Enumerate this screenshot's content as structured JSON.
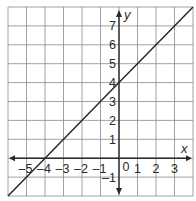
{
  "chart_data": {
    "type": "line",
    "title": "",
    "xlabel": "x",
    "ylabel": "y",
    "xlim": [
      -6,
      4
    ],
    "ylim": [
      -2,
      8
    ],
    "grid": true,
    "x_ticks": [
      "-5",
      "-4",
      "-3",
      "-2",
      "-1",
      "0",
      "1",
      "2",
      "3"
    ],
    "y_ticks": [
      "-1",
      "1",
      "2",
      "3",
      "4",
      "5",
      "6",
      "7"
    ],
    "series": [
      {
        "name": "y = x + 4",
        "equation": "y = x + 4",
        "slope": 1,
        "intercept": 4,
        "x": [
          -6,
          -4,
          0,
          3,
          4
        ],
        "y": [
          -2,
          0,
          4,
          7,
          8
        ]
      }
    ]
  },
  "colors": {
    "grid": "#8a8a8a",
    "axis": "#2a2a2a",
    "line": "#2a2a2a",
    "background": "#ffffff"
  }
}
